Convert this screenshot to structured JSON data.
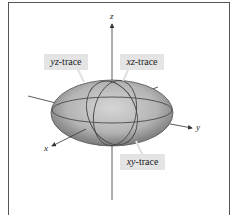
{
  "figure": {
    "type": "ellipsoid-traces",
    "labels": {
      "yz_trace": {
        "var": "yz",
        "suffix": "-trace"
      },
      "xz_trace": {
        "var": "xz",
        "suffix": "-trace"
      },
      "xy_trace": {
        "var": "xy",
        "suffix": "-trace"
      }
    },
    "axes": {
      "x": "x",
      "y": "y",
      "z": "z"
    },
    "colors": {
      "surface_light": "#c8c8c8",
      "surface_dark": "#6a6a6a",
      "label_bg": "#e4e4e4",
      "axis": "#333333"
    }
  }
}
